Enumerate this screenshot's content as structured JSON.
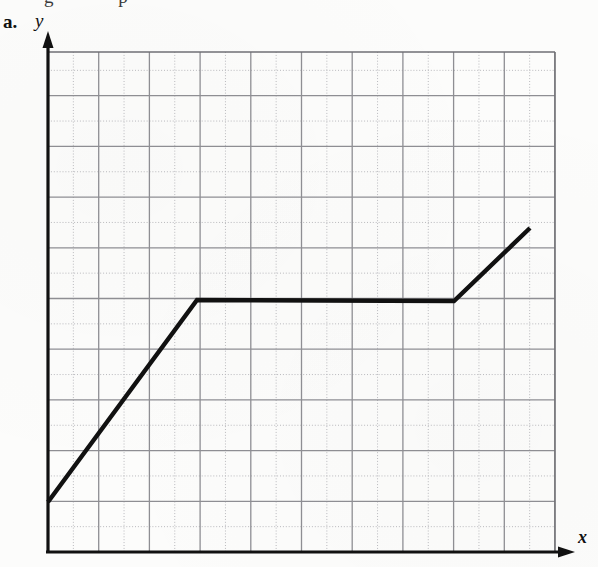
{
  "figure": {
    "part_label": "a.",
    "clipped_text_above": "g p",
    "y_axis_label": "y",
    "x_axis_label": "x",
    "line_color": "#111111",
    "grid_major_color": "#8e8e93",
    "grid_minor_color": "#b9b9bd",
    "axis_color": "#111111",
    "background_color": "#fcfcfb"
  },
  "chart_data": {
    "type": "line",
    "title": "",
    "subtitle": "",
    "xlabel": "x",
    "ylabel": "y",
    "legend": [],
    "annotations": [],
    "grid": true,
    "grid_major_step": 2,
    "grid_minor_step": 1,
    "xlim": [
      0,
      20
    ],
    "ylim": [
      0,
      20
    ],
    "xticks": [],
    "yticks": [],
    "series": [
      {
        "name": "piecewise-linear-graph",
        "comment": "Three segments: rising, constant plateau, rising again",
        "x": [
          0,
          6,
          16.2,
          19.2
        ],
        "y": [
          2,
          10.1,
          10.05,
          13
        ],
        "segments": [
          {
            "from": [
              0,
              2
            ],
            "to": [
              6,
              10.1
            ],
            "shape": "increasing"
          },
          {
            "from": [
              6,
              10.1
            ],
            "to": [
              16.2,
              10.05
            ],
            "shape": "constant"
          },
          {
            "from": [
              16.2,
              10.05
            ],
            "to": [
              19.2,
              13
            ],
            "shape": "increasing"
          }
        ]
      }
    ],
    "pixel_geometry": {
      "plot_left": 48,
      "plot_right": 555,
      "plot_top": 52,
      "plot_bottom": 552,
      "major_spacing": 50.7,
      "minor_spacing": 25.35,
      "vertices_px": [
        [
          48,
          502
        ],
        [
          197,
          300
        ],
        [
          454,
          301
        ],
        [
          530,
          228
        ]
      ]
    }
  }
}
